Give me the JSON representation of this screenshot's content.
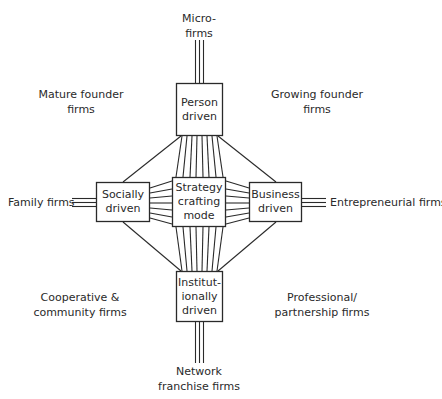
{
  "diagram": {
    "type": "strategy-crafting-mode-framework",
    "center": {
      "id": "strategy",
      "lines": [
        "Strategy",
        "crafting",
        "mode"
      ]
    },
    "modes": [
      {
        "id": "person",
        "position": "top",
        "lines": [
          "Person",
          "driven"
        ]
      },
      {
        "id": "socially",
        "position": "left",
        "lines": [
          "Socially",
          "driven"
        ]
      },
      {
        "id": "business",
        "position": "right",
        "lines": [
          "Business",
          "driven"
        ]
      },
      {
        "id": "institutional",
        "position": "bottom",
        "lines": [
          "Institut-",
          "ionally",
          "driven"
        ]
      }
    ],
    "firm_types": {
      "top": [
        "Micro-",
        "firms"
      ],
      "left": [
        "Family firms"
      ],
      "right": [
        "Entrepreneurial firms"
      ],
      "bottom": [
        "Network",
        "franchise firms"
      ],
      "top_left": [
        "Mature founder",
        "firms"
      ],
      "top_right": [
        "Growing founder",
        "firms"
      ],
      "bottom_left": [
        "Cooperative &",
        "community firms"
      ],
      "bottom_right": [
        "Professional/",
        "partnership firms"
      ]
    },
    "colors": {
      "line": "#2a2a2a",
      "text": "#2a2a2a",
      "background": "#ffffff"
    }
  }
}
